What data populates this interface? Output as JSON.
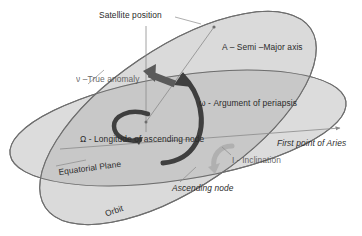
{
  "diagram": {
    "labels": {
      "satellite_position": "Satellite position",
      "semi_major_axis": "A – Semi –Major axis",
      "true_anomaly": "ν –True anomaly",
      "argument_of_periapsis": "ω - Argument of periapsis",
      "longitude_of_ascending_node": "Ω - Longitude of ascending node",
      "first_point_of_aries": "First point of Aries",
      "inclination": "I - Inclination",
      "equatorial_plane": "Equatorial Plane",
      "ascending_node": "Ascending node",
      "orbit": "Orbit"
    },
    "colors": {
      "background": "#ffffff",
      "equatorial_plane_fill": "#dcdcdc",
      "orbit_plane_fill": "#d2d2d2",
      "overlap_fill": "#c4c4c4",
      "plane_stroke": "#6e6e6e",
      "thin_line": "#8a8a8a",
      "arrow_dark": "#3f3f3f",
      "arrow_medium": "#5a5a5a",
      "arrow_light": "#b0b0b0",
      "text": "#2b2b2b"
    },
    "elements": [
      {
        "symbol": "A",
        "name": "Semi-Major axis"
      },
      {
        "symbol": "ν",
        "name": "True anomaly"
      },
      {
        "symbol": "ω",
        "name": "Argument of periapsis"
      },
      {
        "symbol": "Ω",
        "name": "Longitude of ascending node"
      },
      {
        "symbol": "I",
        "name": "Inclination"
      }
    ]
  }
}
